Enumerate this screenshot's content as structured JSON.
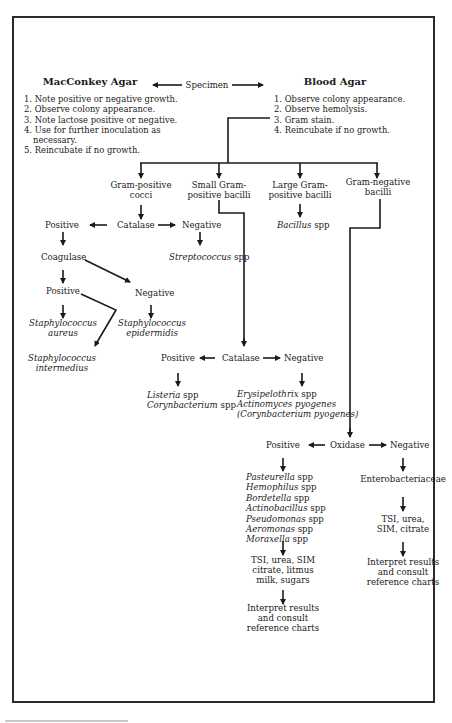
{
  "header": {
    "left_title": "MacConkey Agar",
    "center_title": "Specimen",
    "right_title": "Blood Agar"
  },
  "macconkey_steps": [
    "1. Note positive or negative growth.",
    "2. Observe colony appearance.",
    "3. Note lactose positive or negative.",
    "4. Use for further inoculation as",
    "necessary.",
    "5. Reincubate if no growth."
  ],
  "blood_agar_steps": [
    "1. Observe colony appearance.",
    "2. Observe hemolysis.",
    "3. Gram stain.",
    "4. Reincubate if no growth."
  ],
  "gram_branches": [
    {
      "line1": "Gram-positive",
      "line2": "cocci"
    },
    {
      "line1": "Small Gram-",
      "line2": "positive bacilli"
    },
    {
      "line1": "Large Gram-",
      "line2": "positive bacilli"
    },
    {
      "line1": "Gram-negative",
      "line2": "bacilli"
    }
  ],
  "cocci": {
    "catalase": "Catalase",
    "positive": "Positive",
    "negative": "Negative",
    "negative_result": {
      "genus": "Streptococcus",
      "suffix": " spp"
    },
    "coagulase": "Coagulase",
    "coag_positive": "Positive",
    "coag_negative": "Negative",
    "staph_aureus": {
      "line1": "Staphylococcus",
      "line2": "aureus"
    },
    "staph_epidermidis": {
      "line1": "Staphylococcus",
      "line2": "epidermidis"
    },
    "staph_intermedius": {
      "line1": "Staphylococcus",
      "line2": "intermedius"
    }
  },
  "large_bacilli": {
    "result": {
      "genus": "Bacillus",
      "suffix": " spp"
    }
  },
  "small_bacilli": {
    "catalase": "Catalase",
    "positive": "Positive",
    "negative": "Negative",
    "positive_results": [
      {
        "genus": "Listeria",
        "suffix": " spp"
      },
      {
        "genus": "Corynbacterium",
        "suffix": " spp"
      }
    ],
    "negative_results": [
      {
        "genus": "Erysipelothrix",
        "suffix": " spp"
      },
      {
        "genus": "Actinomyces pyogenes",
        "suffix": ""
      },
      {
        "genus": "(Corynbacterium pyogenes)",
        "suffix": ""
      }
    ]
  },
  "gram_negative": {
    "oxidase": "Oxidase",
    "positive": "Positive",
    "negative": "Negative",
    "positive_results": [
      {
        "genus": "Pasteurella",
        "suffix": " spp"
      },
      {
        "genus": "Hemophilus",
        "suffix": " spp"
      },
      {
        "genus": "Bordetella",
        "suffix": " spp"
      },
      {
        "genus": "Actinobacillus",
        "suffix": " spp"
      },
      {
        "genus": "Pseudomonas",
        "suffix": " spp"
      },
      {
        "genus": "Aeromonas",
        "suffix": " spp"
      },
      {
        "genus": "Moraxella",
        "suffix": " spp"
      }
    ],
    "positive_tests": [
      "TSI, urea, SIM",
      "citrate, litmus",
      "milk, sugars"
    ],
    "positive_interpret": [
      "Interpret results",
      "and consult",
      "reference charts"
    ],
    "negative_family": "Enterobacteriaceae",
    "negative_tests": [
      "TSI, urea,",
      "SIM, citrate"
    ],
    "negative_interpret": [
      "Interpret results",
      "and consult",
      "reference charts"
    ]
  }
}
